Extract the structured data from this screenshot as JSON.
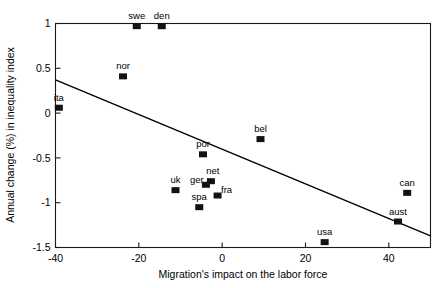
{
  "chart_data": {
    "type": "scatter",
    "title": "",
    "xlabel": "Migration's impact on the labor force",
    "ylabel": "Annual change (%) in inequality index",
    "xlim": [
      -40,
      50
    ],
    "ylim": [
      -1.5,
      1
    ],
    "grid": false,
    "legend": "none",
    "xticks": [
      -40,
      -20,
      0,
      20,
      40
    ],
    "xticklabels": [
      "-40",
      "-20",
      "0",
      "20",
      "40"
    ],
    "yticks": [
      1,
      0.5,
      0,
      -0.5,
      -1,
      -1.5
    ],
    "yticklabels": [
      "1",
      "0.5",
      "0",
      "-0.5",
      "-1",
      "-1.5"
    ],
    "marker_shape": "square",
    "marker_color": "#121212",
    "points": [
      {
        "label": "swe",
        "x": -20.5,
        "y": 0.97,
        "label_dx": 0,
        "label_dy": -7
      },
      {
        "label": "den",
        "x": -14.5,
        "y": 0.97,
        "label_dx": 0,
        "label_dy": -7
      },
      {
        "label": "nor",
        "x": -23.8,
        "y": 0.41,
        "label_dx": 0,
        "label_dy": -7
      },
      {
        "label": "ita",
        "x": -39.2,
        "y": 0.06,
        "label_dx": 0,
        "label_dy": -7
      },
      {
        "label": "bel",
        "x": 9.2,
        "y": -0.29,
        "label_dx": 0,
        "label_dy": -7
      },
      {
        "label": "por",
        "x": -4.6,
        "y": -0.46,
        "label_dx": 0,
        "label_dy": -7
      },
      {
        "label": "net",
        "x": -2.7,
        "y": -0.76,
        "label_dx": 2,
        "label_dy": -7
      },
      {
        "label": "ger",
        "x": -3.9,
        "y": -0.8,
        "label_dx": -9,
        "label_dy": -2
      },
      {
        "label": "uk",
        "x": -11.2,
        "y": -0.86,
        "label_dx": 0,
        "label_dy": -7
      },
      {
        "label": "can",
        "x": 44.4,
        "y": -0.89,
        "label_dx": 0,
        "label_dy": -7
      },
      {
        "label": "fra",
        "x": -1.1,
        "y": -0.92,
        "label_dx": 9,
        "label_dy": -3
      },
      {
        "label": "spa",
        "x": -5.5,
        "y": -1.05,
        "label_dx": 0,
        "label_dy": -7
      },
      {
        "label": "aust",
        "x": 42.2,
        "y": -1.21,
        "label_dx": 0,
        "label_dy": -7
      },
      {
        "label": "usa",
        "x": 24.6,
        "y": -1.44,
        "label_dx": 0,
        "label_dy": -7
      }
    ],
    "fit_line": {
      "name": "regression-line",
      "x_start": -40,
      "y_start": 0.37,
      "x_end": 50,
      "y_end": -1.37
    }
  }
}
